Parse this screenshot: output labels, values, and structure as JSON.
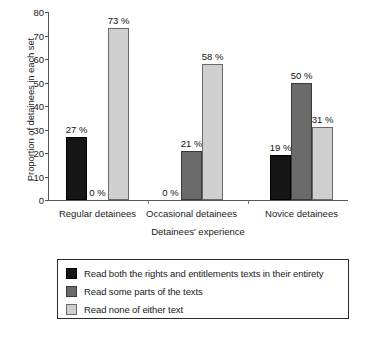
{
  "chart_data": {
    "type": "bar",
    "title": "",
    "xlabel": "Detainees' experience",
    "ylabel": "Proportion of detainees in each set",
    "categories": [
      "Regular detainees",
      "Occasional detainees",
      "Novice detainees"
    ],
    "series": [
      {
        "name": "Read both the rights and entitlements texts in their entirety",
        "color": "#161616",
        "values": [
          27,
          0,
          19
        ],
        "labels": [
          "27 %",
          "0 %",
          "19 %"
        ]
      },
      {
        "name": "Read some parts of the texts",
        "color": "#6b6b6b",
        "values": [
          0,
          21,
          50
        ],
        "labels": [
          "0 %",
          "21 %",
          "50 %"
        ]
      },
      {
        "name": "Read none of either text",
        "color": "#cfcfcf",
        "values": [
          73,
          58,
          31
        ],
        "labels": [
          "73 %",
          "58 %",
          "31 %"
        ]
      }
    ],
    "ylim": [
      0,
      80
    ],
    "yticks": [
      "0",
      "10",
      "20",
      "30",
      "40",
      "50",
      "60",
      "70",
      "80"
    ],
    "grid": false,
    "legend_position": "bottom"
  },
  "legend": {
    "entries": [
      "Read both the rights and entitlements texts in their entirety",
      "Read some parts of the texts",
      "Read none of either text"
    ]
  },
  "axis": {
    "y_title": "Proportion of detainees in each set",
    "x_title": "Detainees' experience"
  }
}
